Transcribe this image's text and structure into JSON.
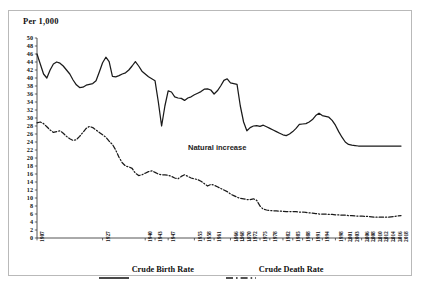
{
  "frame": {
    "border_color": "#b9b9b9"
  },
  "axis_title": "Per 1,000",
  "annotation": "Natural increase",
  "legend": {
    "birth": "Crude Birth Rate",
    "death": "Crude Death Rate"
  },
  "chart_data": {
    "type": "line",
    "title": "",
    "subtitle": "",
    "xlabel": "",
    "ylabel": "Per 1,000",
    "ylim": [
      0,
      50
    ],
    "ytick_step": 2,
    "yticks": [
      50,
      48,
      46,
      44,
      42,
      40,
      38,
      36,
      34,
      32,
      30,
      28,
      26,
      24,
      22,
      20,
      18,
      16,
      14,
      12,
      10,
      8,
      6,
      4,
      2,
      0
    ],
    "grid": false,
    "legend_position": "bottom",
    "annotations": [
      {
        "text": "Natural increase",
        "x": 1976,
        "y": 21
      }
    ],
    "xtick_labels": [
      "1907",
      "1927",
      "1940",
      "1943",
      "1947",
      "1955",
      "1958",
      "1961",
      "1966",
      "1968",
      "1970",
      "1972",
      "1975",
      "1978",
      "1982",
      "1985",
      "1988",
      "1991",
      "1994",
      "1998",
      "2001",
      "2003",
      "2006",
      "2008",
      "2010",
      "2012",
      "2014",
      "2016",
      "2018"
    ],
    "x": [
      1907,
      1908,
      1909,
      1910,
      1911,
      1912,
      1913,
      1914,
      1915,
      1916,
      1917,
      1918,
      1919,
      1920,
      1921,
      1922,
      1923,
      1924,
      1925,
      1926,
      1927,
      1928,
      1929,
      1930,
      1931,
      1932,
      1933,
      1934,
      1935,
      1936,
      1937,
      1938,
      1939,
      1940,
      1941,
      1942,
      1943,
      1944,
      1945,
      1946,
      1947,
      1948,
      1949,
      1950,
      1951,
      1952,
      1953,
      1954,
      1955,
      1956,
      1957,
      1958,
      1959,
      1960,
      1961,
      1962,
      1963,
      1964,
      1965,
      1966,
      1967,
      1968,
      1969,
      1970,
      1971,
      1972,
      1973,
      1974,
      1975,
      1976,
      1977,
      1978,
      1979,
      1980,
      1981,
      1982,
      1983,
      1984,
      1985,
      1986,
      1987,
      1988,
      1989,
      1990,
      1991,
      1992,
      1993,
      1994,
      1995,
      1996,
      1997,
      1998,
      1999,
      2000,
      2001,
      2002,
      2003,
      2004,
      2005,
      2006,
      2007,
      2008,
      2009,
      2010,
      2011,
      2012,
      2013,
      2014,
      2015,
      2016,
      2017,
      2018
    ],
    "series": [
      {
        "name": "Crude Birth Rate",
        "style": "solid",
        "color": "#1a1a1a",
        "values": [
          46.0,
          43.5,
          41.0,
          40.0,
          42.0,
          43.5,
          44.0,
          43.7,
          43.0,
          42.0,
          41.0,
          39.5,
          38.3,
          37.6,
          37.7,
          38.2,
          38.4,
          38.6,
          39.3,
          41.5,
          43.8,
          45.2,
          44.1,
          40.4,
          40.3,
          40.6,
          41.0,
          41.3,
          42.0,
          43.0,
          44.1,
          43.0,
          41.7,
          41.0,
          40.3,
          39.8,
          39.3,
          34.0,
          28.0,
          33.0,
          36.8,
          36.5,
          35.3,
          35.0,
          34.9,
          34.4,
          35.0,
          35.3,
          35.8,
          36.2,
          36.6,
          37.2,
          37.3,
          37.0,
          36.0,
          36.8,
          38.0,
          39.4,
          39.8,
          38.8,
          38.6,
          38.4,
          33.0,
          29.0,
          26.8,
          27.6,
          28.0,
          28.1,
          27.9,
          28.2,
          27.8,
          27.4,
          27.0,
          26.6,
          26.2,
          25.8,
          25.6,
          26.0,
          26.6,
          27.4,
          28.4,
          28.5,
          28.6,
          29.0,
          29.6,
          30.6,
          31.2,
          30.6,
          30.4,
          30.2,
          29.4,
          28.2,
          26.6,
          25.2,
          24.0,
          23.4,
          23.2,
          23.1,
          23.0,
          23.0,
          23.0,
          23.0,
          23.0,
          23.0,
          23.0,
          23.0,
          23.0,
          23.0,
          23.0,
          23.0,
          23.0,
          23.0
        ]
      },
      {
        "name": "Crude Death Rate",
        "style": "dashdot",
        "color": "#1a1a1a",
        "values": [
          28.8,
          29.0,
          28.6,
          27.8,
          27.0,
          26.4,
          26.6,
          26.8,
          26.2,
          25.4,
          24.8,
          24.4,
          24.6,
          25.4,
          26.4,
          27.4,
          27.9,
          27.6,
          27.0,
          26.4,
          25.8,
          25.2,
          24.2,
          23.4,
          22.0,
          20.2,
          18.8,
          18.0,
          17.8,
          17.4,
          16.2,
          15.6,
          15.8,
          16.2,
          16.6,
          16.8,
          16.4,
          16.0,
          15.8,
          15.8,
          15.7,
          15.4,
          15.0,
          14.8,
          15.4,
          15.8,
          15.4,
          15.0,
          14.8,
          14.6,
          14.2,
          13.6,
          13.0,
          13.4,
          13.2,
          12.8,
          12.4,
          12.0,
          11.6,
          11.0,
          10.6,
          10.2,
          9.9,
          9.8,
          9.6,
          9.6,
          9.8,
          9.4,
          8.0,
          7.2,
          7.0,
          6.9,
          6.8,
          6.8,
          6.7,
          6.7,
          6.6,
          6.6,
          6.6,
          6.6,
          6.5,
          6.5,
          6.4,
          6.3,
          6.2,
          6.1,
          6.0,
          6.0,
          6.0,
          5.9,
          5.9,
          5.8,
          5.8,
          5.7,
          5.7,
          5.6,
          5.6,
          5.5,
          5.5,
          5.5,
          5.4,
          5.4,
          5.3,
          5.2,
          5.2,
          5.2,
          5.2,
          5.2,
          5.3,
          5.4,
          5.5,
          5.6
        ]
      }
    ]
  }
}
